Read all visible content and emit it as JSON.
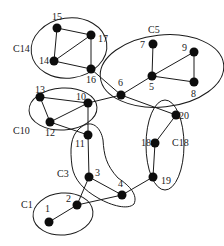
{
  "diagram": {
    "type": "clustered-graph",
    "nodes": [
      {
        "id": "1",
        "label": "1",
        "x": 49,
        "y": 222,
        "lx": 45,
        "ly": 212
      },
      {
        "id": "2",
        "label": "2",
        "x": 77,
        "y": 205,
        "lx": 66,
        "ly": 202
      },
      {
        "id": "3",
        "label": "3",
        "x": 89,
        "y": 177,
        "lx": 95,
        "ly": 176
      },
      {
        "id": "4",
        "label": "4",
        "x": 122,
        "y": 195,
        "lx": 118,
        "ly": 187
      },
      {
        "id": "5",
        "label": "5",
        "x": 152,
        "y": 76,
        "lx": 149,
        "ly": 90
      },
      {
        "id": "6",
        "label": "6",
        "x": 121,
        "y": 95,
        "lx": 118,
        "ly": 86
      },
      {
        "id": "7",
        "label": "7",
        "x": 153,
        "y": 44,
        "lx": 140,
        "ly": 48
      },
      {
        "id": "8",
        "label": "8",
        "x": 194,
        "y": 82,
        "lx": 191,
        "ly": 97
      },
      {
        "id": "9",
        "label": "9",
        "x": 194,
        "y": 52,
        "lx": 182,
        "ly": 51
      },
      {
        "id": "10",
        "label": "10",
        "x": 88,
        "y": 103,
        "lx": 76,
        "ly": 100
      },
      {
        "id": "11",
        "label": "11",
        "x": 88,
        "y": 135,
        "lx": 75,
        "ly": 147
      },
      {
        "id": "12",
        "label": "12",
        "x": 50,
        "y": 122,
        "lx": 45,
        "ly": 136
      },
      {
        "id": "13",
        "label": "13",
        "x": 40,
        "y": 97,
        "lx": 35,
        "ly": 93
      },
      {
        "id": "14",
        "label": "14",
        "x": 54,
        "y": 61,
        "lx": 39,
        "ly": 64
      },
      {
        "id": "15",
        "label": "15",
        "x": 57,
        "y": 28,
        "lx": 52,
        "ly": 20
      },
      {
        "id": "16",
        "label": "16",
        "x": 91,
        "y": 69,
        "lx": 86,
        "ly": 83
      },
      {
        "id": "17",
        "label": "17",
        "x": 91,
        "y": 35,
        "lx": 98,
        "ly": 42
      },
      {
        "id": "18",
        "label": "18",
        "x": 155,
        "y": 143,
        "lx": 141,
        "ly": 146
      },
      {
        "id": "19",
        "label": "19",
        "x": 153,
        "y": 177,
        "lx": 161,
        "ly": 184
      },
      {
        "id": "20",
        "label": "20",
        "x": 176,
        "y": 115,
        "lx": 179,
        "ly": 119
      }
    ],
    "edges": [
      [
        "15",
        "17"
      ],
      [
        "15",
        "14"
      ],
      [
        "14",
        "17"
      ],
      [
        "14",
        "16"
      ],
      [
        "17",
        "16"
      ],
      [
        "16",
        "6"
      ],
      [
        "7",
        "5"
      ],
      [
        "5",
        "9"
      ],
      [
        "9",
        "8"
      ],
      [
        "5",
        "8"
      ],
      [
        "5",
        "6"
      ],
      [
        "6",
        "10"
      ],
      [
        "6",
        "20"
      ],
      [
        "13",
        "10"
      ],
      [
        "13",
        "12"
      ],
      [
        "12",
        "10"
      ],
      [
        "12",
        "11"
      ],
      [
        "10",
        "11"
      ],
      [
        "11",
        "3"
      ],
      [
        "3",
        "4"
      ],
      [
        "3",
        "2"
      ],
      [
        "2",
        "4"
      ],
      [
        "2",
        "1"
      ],
      [
        "4",
        "19"
      ],
      [
        "20",
        "18"
      ],
      [
        "18",
        "19"
      ]
    ],
    "clusters": [
      {
        "id": "C14",
        "label": "C14",
        "lx": 13,
        "ly": 52
      },
      {
        "id": "C5",
        "label": "C5",
        "lx": 148,
        "ly": 33
      },
      {
        "id": "C10",
        "label": "C10",
        "lx": 13,
        "ly": 134
      },
      {
        "id": "C18",
        "label": "C18",
        "lx": 172,
        "ly": 146
      },
      {
        "id": "C3",
        "label": "C3",
        "lx": 57,
        "ly": 177
      },
      {
        "id": "C1",
        "label": "C1",
        "lx": 21,
        "ly": 208
      }
    ]
  }
}
